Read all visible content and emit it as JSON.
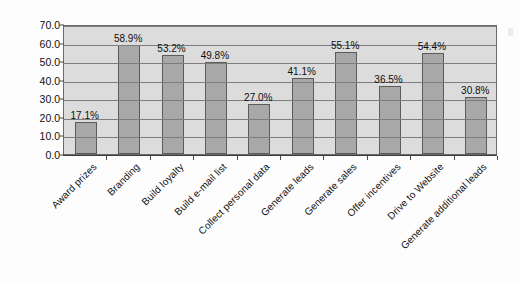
{
  "chart_data": {
    "type": "bar",
    "title": "",
    "xlabel": "",
    "ylabel": "Percent of Total",
    "ylim": [
      0.0,
      70.0
    ],
    "ytick_step": 10.0,
    "yticks": [
      "0.0",
      "10.0",
      "20.0",
      "30.0",
      "40.0",
      "50.0",
      "60.0",
      "70.0"
    ],
    "grid": true,
    "legend": "none",
    "value_label_suffix": "%",
    "categories": [
      "Award prizes",
      "Branding",
      "Build loyalty",
      "Build e-mail list",
      "Collect personal data",
      "Generate leads",
      "Generate sales",
      "Offer incentives",
      "Drive to Website",
      "Generate additional leads"
    ],
    "values": [
      17.1,
      58.9,
      53.2,
      49.8,
      27.0,
      41.1,
      55.1,
      36.5,
      54.4,
      30.8
    ],
    "value_labels": [
      "17.1%",
      "58.9%",
      "53.2%",
      "49.8%",
      "27.0%",
      "41.1%",
      "55.1%",
      "36.5%",
      "54.4%",
      "30.8%"
    ],
    "colors": {
      "bar_fill": "#a8a8a8",
      "bar_edge": "#5b5b5b",
      "plot_background": "#dcdcdc",
      "gridline": "#7d7d7d",
      "axis": "#3c3c3c",
      "text": "#101010",
      "figure_background": "#fdfdfd"
    }
  }
}
